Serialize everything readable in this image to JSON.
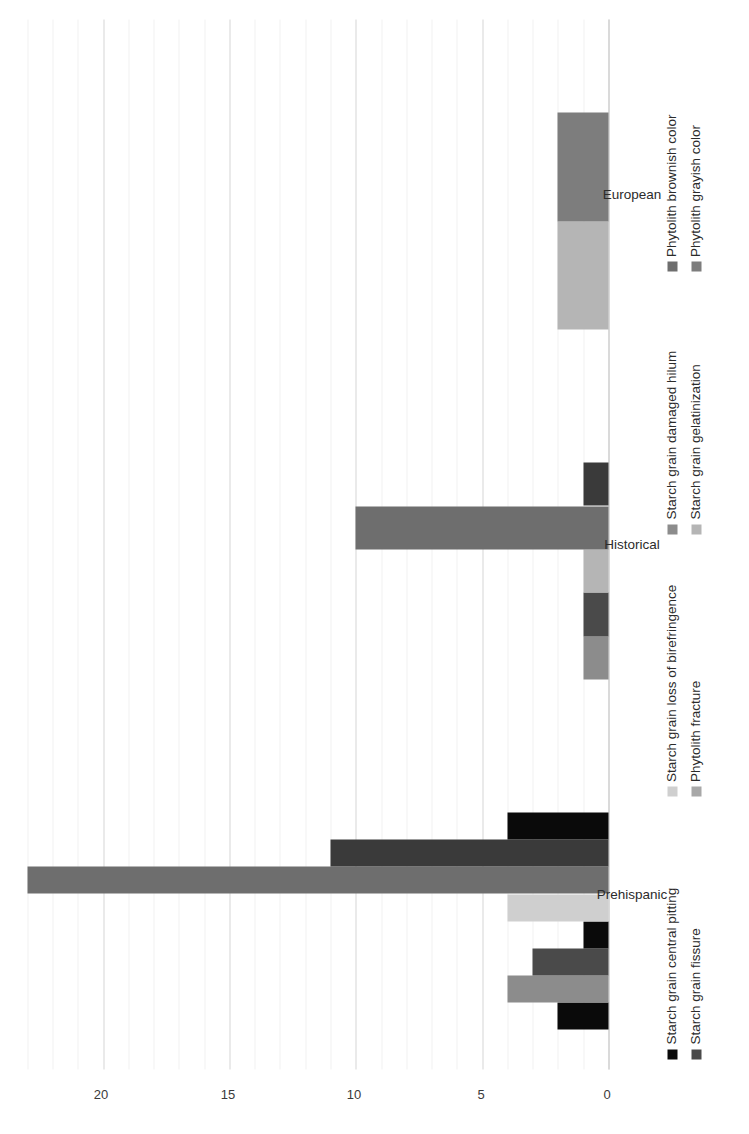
{
  "chart_data": {
    "type": "bar",
    "orientation": "horizontal",
    "title": "",
    "xlabel": "",
    "ylabel": "",
    "categories": [
      "Prehispanic",
      "Historical",
      "European"
    ],
    "tick_labels": [
      "0",
      "5",
      "10",
      "15",
      "20"
    ],
    "tick_values": [
      0,
      5,
      10,
      15,
      20
    ],
    "axis_range": [
      0,
      23.5
    ],
    "major_tick_step": 5,
    "minor_tick_step": 1,
    "grid": true,
    "legend_position": "bottom",
    "series": [
      {
        "name": "Starch grain central pitting",
        "color": "#0a0a0a",
        "values": [
          2,
          1,
          0
        ]
      },
      {
        "name": "Starch grain loss of birefringence",
        "color": "#cfcfcf",
        "values": [
          4,
          1,
          0
        ]
      },
      {
        "name": "Starch grain damaged hilum",
        "color": "#8c8c8c",
        "values": [
          3,
          1,
          0
        ]
      },
      {
        "name": "Phytolith brownish color",
        "color": "#6e6e6e",
        "values": [
          23,
          10,
          0
        ]
      },
      {
        "name": "Starch grain fissure",
        "color": "#4a4a4a",
        "values": [
          4,
          1,
          0
        ]
      },
      {
        "name": "Phytolith fracture",
        "color": "#a8a8a8",
        "values": [
          4,
          1,
          0
        ]
      },
      {
        "name": "Starch grain gelatinization",
        "color": "#b5b5b5",
        "values": [
          0,
          0,
          2
        ]
      },
      {
        "name": "Phytolith grayish color",
        "color": "#7d7d7d",
        "values": [
          0,
          0,
          2
        ]
      }
    ],
    "legend": [
      {
        "label": "Starch grain central pitting",
        "color": "#0a0a0a"
      },
      {
        "label": "Starch grain loss of birefringence",
        "color": "#cfcfcf"
      },
      {
        "label": "Starch grain damaged hilum",
        "color": "#8c8c8c"
      },
      {
        "label": "Phytolith brownish color",
        "color": "#6e6e6e"
      },
      {
        "label": "Starch grain fissure",
        "color": "#4a4a4a"
      },
      {
        "label": "Phytolith fracture",
        "color": "#a8a8a8"
      },
      {
        "label": "Starch grain gelatinization",
        "color": "#b5b5b5"
      },
      {
        "label": "Phytolith grayish color",
        "color": "#7d7d7d"
      }
    ],
    "group_bars": {
      "Prehispanic": [
        {
          "series": "Starch grain central pitting",
          "value": 2,
          "color": "#0a0a0a"
        },
        {
          "series": "Phytolith fracture",
          "value": 4,
          "color": "#8c8c8c"
        },
        {
          "series": "Starch grain fissure",
          "value": 3,
          "color": "#4a4a4a"
        },
        {
          "series": "Starch grain loss of birefringence",
          "value": 1,
          "color": "#0a0a0a"
        },
        {
          "series": "Starch grain damaged hilum",
          "value": 4,
          "color": "#cfcfcf"
        },
        {
          "series": "Phytolith brownish color",
          "value": 23,
          "color": "#6e6e6e"
        },
        {
          "series": "Phytolith grayish color",
          "value": 11,
          "color": "#3a3a3a"
        },
        {
          "series": "Starch grain gelatinization",
          "value": 4,
          "color": "#0a0a0a"
        }
      ],
      "Historical": [
        {
          "series": "Starch grain central pitting",
          "value": 1,
          "color": "#8c8c8c"
        },
        {
          "series": "Starch grain loss of birefringence",
          "value": 1,
          "color": "#4a4a4a"
        },
        {
          "series": "Starch grain damaged hilum",
          "value": 1,
          "color": "#b5b5b5"
        },
        {
          "series": "Phytolith brownish color",
          "value": 10,
          "color": "#6e6e6e"
        },
        {
          "series": "Starch grain fissure",
          "value": 1,
          "color": "#3a3a3a"
        }
      ],
      "European": [
        {
          "series": "Starch grain gelatinization",
          "value": 2,
          "color": "#b5b5b5"
        },
        {
          "series": "Phytolith grayish color",
          "value": 2,
          "color": "#7d7d7d"
        }
      ]
    }
  },
  "axis": {
    "ticks": [
      {
        "label": "20",
        "value": 20
      },
      {
        "label": "15",
        "value": 15
      },
      {
        "label": "10",
        "value": 10
      },
      {
        "label": "5",
        "value": 5
      },
      {
        "label": "0",
        "value": 0
      }
    ]
  },
  "groups": [
    {
      "label": "Prehispanic"
    },
    {
      "label": "Historical"
    },
    {
      "label": "European"
    }
  ]
}
